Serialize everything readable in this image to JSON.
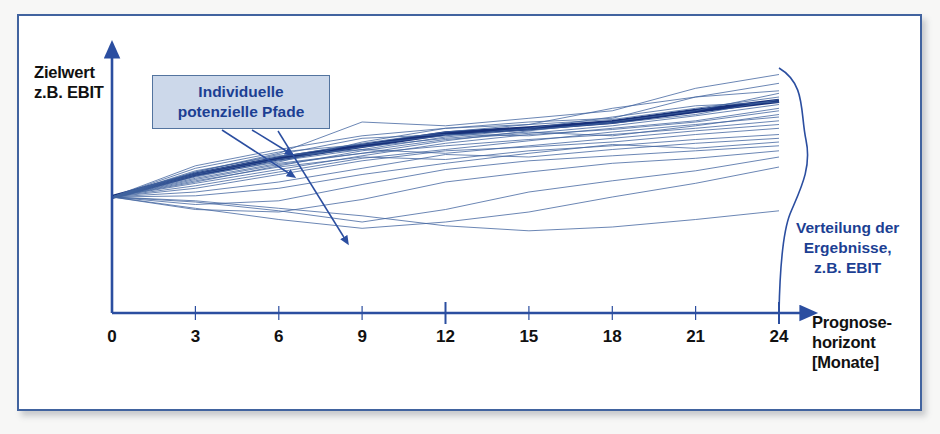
{
  "figure": {
    "background_color": "#f7f7f6",
    "frame_border_color": "#41639f",
    "line_color": "#41639f",
    "mean_line_color": "#17307a",
    "axis_color": "#2b4ea0",
    "callout_fill": "#ccd8ea",
    "callout_text_color": "#1c3f93",
    "axis_label_color": "#111111"
  },
  "labels": {
    "y_axis": "Zielwert\nz.B. EBIT",
    "x_axis": "Prognose-\nhorizont\n[Monate]",
    "callout": "Individuelle\npotenzielle Pfade",
    "distribution": "Verteilung der\nErgebnisse,\nz.B. EBIT"
  },
  "chart_data": {
    "type": "line",
    "title": "",
    "xlabel": "Prognosehorizont [Monate]",
    "ylabel": "Zielwert z.B. EBIT",
    "xlim": [
      0,
      24
    ],
    "ylim": [
      0,
      1
    ],
    "grid": false,
    "legend_position": "none",
    "annotations": [
      {
        "text": "Individuelle potenzielle Pfade",
        "type": "callout-box",
        "points_to": "simulation-paths"
      },
      {
        "text": "Verteilung der Ergebnisse, z.B. EBIT",
        "type": "side-label",
        "points_to": "outcome-distribution"
      }
    ],
    "x": [
      0,
      3,
      6,
      9,
      12,
      15,
      18,
      21,
      24
    ],
    "tick_labels": [
      "0",
      "3",
      "6",
      "9",
      "12",
      "15",
      "18",
      "21",
      "24"
    ],
    "series": [
      {
        "name": "Mittelwertpfad (Erwartungswert)",
        "emphasis": "thick",
        "values": [
          0.0,
          0.09,
          0.155,
          0.205,
          0.255,
          0.275,
          0.3,
          0.345,
          0.385
        ]
      },
      {
        "name": "Pfad 1",
        "values": [
          0.0,
          0.1,
          0.175,
          0.3,
          0.285,
          0.315,
          0.345,
          0.435,
          0.49
        ]
      },
      {
        "name": "Pfad 2",
        "values": [
          0.0,
          0.085,
          0.14,
          0.22,
          0.275,
          0.3,
          0.315,
          0.4,
          0.455
        ]
      },
      {
        "name": "Pfad 3",
        "values": [
          0.0,
          0.125,
          0.19,
          0.245,
          0.275,
          0.29,
          0.355,
          0.4,
          0.425
        ]
      },
      {
        "name": "Pfad 4",
        "values": [
          0.0,
          0.07,
          0.13,
          0.175,
          0.225,
          0.265,
          0.3,
          0.345,
          0.415
        ]
      },
      {
        "name": "Pfad 5",
        "values": [
          0.0,
          0.095,
          0.16,
          0.215,
          0.26,
          0.29,
          0.31,
          0.355,
          0.4
        ]
      },
      {
        "name": "Pfad 6",
        "values": [
          0.0,
          0.08,
          0.145,
          0.19,
          0.24,
          0.27,
          0.295,
          0.33,
          0.39
        ]
      },
      {
        "name": "Pfad 7",
        "values": [
          0.0,
          0.115,
          0.18,
          0.21,
          0.245,
          0.275,
          0.32,
          0.365,
          0.38
        ]
      },
      {
        "name": "Pfad 8",
        "values": [
          0.0,
          0.06,
          0.125,
          0.185,
          0.23,
          0.255,
          0.285,
          0.325,
          0.37
        ]
      },
      {
        "name": "Pfad 9",
        "values": [
          0.0,
          0.1,
          0.17,
          0.235,
          0.25,
          0.245,
          0.275,
          0.305,
          0.355
        ]
      },
      {
        "name": "Pfad 10",
        "values": [
          0.0,
          0.055,
          0.11,
          0.165,
          0.215,
          0.25,
          0.27,
          0.3,
          0.345
        ]
      },
      {
        "name": "Pfad 11",
        "values": [
          0.0,
          0.09,
          0.15,
          0.2,
          0.235,
          0.26,
          0.245,
          0.285,
          0.33
        ]
      },
      {
        "name": "Pfad 12",
        "values": [
          0.0,
          0.045,
          0.1,
          0.155,
          0.19,
          0.225,
          0.26,
          0.29,
          0.32
        ]
      },
      {
        "name": "Pfad 13",
        "values": [
          0.0,
          0.075,
          0.135,
          0.175,
          0.205,
          0.23,
          0.25,
          0.275,
          0.305
        ]
      },
      {
        "name": "Pfad 14",
        "values": [
          0.0,
          0.105,
          0.165,
          0.19,
          0.175,
          0.205,
          0.235,
          0.265,
          0.29
        ]
      },
      {
        "name": "Pfad 15",
        "values": [
          0.0,
          0.035,
          0.09,
          0.145,
          0.185,
          0.2,
          0.22,
          0.25,
          0.275
        ]
      },
      {
        "name": "Pfad 16",
        "values": [
          0.0,
          0.065,
          0.12,
          0.16,
          0.15,
          0.185,
          0.205,
          0.23,
          0.25
        ]
      },
      {
        "name": "Pfad 17",
        "values": [
          0.0,
          0.02,
          0.06,
          0.115,
          0.17,
          0.16,
          0.19,
          0.215,
          0.235
        ]
      },
      {
        "name": "Pfad 18",
        "values": [
          0.0,
          0.005,
          0.035,
          0.09,
          0.135,
          0.175,
          0.21,
          0.195,
          0.22
        ]
      },
      {
        "name": "Pfad 19",
        "values": [
          0.0,
          -0.03,
          -0.015,
          0.05,
          0.11,
          0.145,
          0.165,
          0.185,
          0.205
        ]
      },
      {
        "name": "Pfad 20",
        "values": [
          0.0,
          -0.05,
          -0.06,
          -0.01,
          0.06,
          0.1,
          0.135,
          0.155,
          0.185
        ]
      },
      {
        "name": "Pfad 21",
        "values": [
          0.0,
          -0.02,
          -0.055,
          -0.1,
          -0.05,
          0.02,
          0.065,
          0.105,
          0.16
        ]
      },
      {
        "name": "Pfad 22",
        "values": [
          0.0,
          -0.045,
          -0.09,
          -0.125,
          -0.1,
          -0.06,
          0.0,
          0.055,
          0.12
        ]
      },
      {
        "name": "Pfad 23",
        "values": [
          0.0,
          -0.015,
          -0.045,
          -0.075,
          -0.115,
          -0.135,
          -0.12,
          -0.09,
          -0.055
        ]
      }
    ],
    "distribution": {
      "at_x": 24,
      "shape": "bell",
      "orientation": "vertical",
      "peak_y": 0.385
    }
  }
}
